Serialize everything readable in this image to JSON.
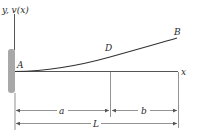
{
  "diagram": {
    "type": "cantilever beam deflection",
    "axis_labels": {
      "y": "y, v(x)",
      "x": "x"
    },
    "points": {
      "A": "A",
      "D": "D",
      "B": "B"
    },
    "dimensions": {
      "a": "a",
      "b": "b",
      "L": "L"
    },
    "colors": {
      "line": "#3a3a3a",
      "wall": "#a8a8a8",
      "dim": "#6a6a6a"
    }
  }
}
